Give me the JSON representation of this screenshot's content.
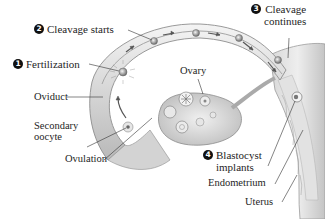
{
  "diagram": {
    "steps": [
      {
        "number": "1",
        "label": "Fertilization"
      },
      {
        "number": "2",
        "label": "Cleavage starts"
      },
      {
        "number": "3",
        "label_line1": "Cleavage",
        "label_line2": "continues"
      },
      {
        "number": "4",
        "label_line1": "Blastocyst",
        "label_line2": "implants"
      }
    ],
    "structures": {
      "ovary": "Ovary",
      "oviduct": "Oviduct",
      "secondary_oocyte_line1": "Secondary",
      "secondary_oocyte_line2": "oocyte",
      "ovulation": "Ovulation",
      "endometrium": "Endometrium",
      "uterus": "Uterus"
    },
    "colors": {
      "tissue_light": "#ececec",
      "tissue_mid": "#cfcfcf",
      "tissue_dark": "#9a9a9a",
      "leader_line": "#333333",
      "badge": "#111111"
    }
  }
}
